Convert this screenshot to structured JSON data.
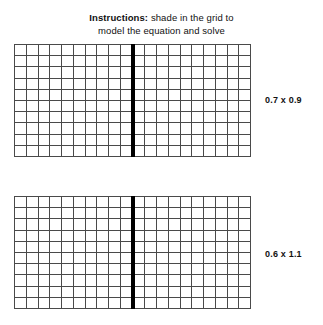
{
  "worksheet": {
    "instructions": {
      "lead": "Instructions:",
      "line1": " shade in the grid to",
      "line2": "model the equation and solve"
    },
    "models": [
      {
        "id": "model-1",
        "equation": "0.7 x 0.9",
        "grid": {
          "panels": 2,
          "columns_per_panel": 10,
          "rows_per_panel": 10,
          "total_columns": 20,
          "total_rows": 10,
          "shaded_cells": 0,
          "divider": "thick-black-vertical",
          "line_color": "#4a4a4a",
          "divider_color": "#000000",
          "cell_fill": "#ffffff"
        }
      },
      {
        "id": "model-2",
        "equation": "0.6 x 1.1",
        "grid": {
          "panels": 2,
          "columns_per_panel": 10,
          "rows_per_panel": 10,
          "total_columns": 20,
          "total_rows": 10,
          "shaded_cells": 0,
          "divider": "thick-black-vertical",
          "line_color": "#4a4a4a",
          "divider_color": "#000000",
          "cell_fill": "#ffffff"
        }
      }
    ]
  }
}
